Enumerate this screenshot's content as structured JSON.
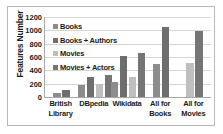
{
  "chart_data": {
    "type": "bar",
    "title": "",
    "xlabel": "",
    "ylabel": "Features Number",
    "ylim": [
      0,
      1200
    ],
    "yticks": [
      1200,
      1000,
      800,
      600,
      400,
      200,
      0
    ],
    "grid": true,
    "legend_position": "upper-left",
    "categories": [
      "British Library",
      "DBpedia",
      "Wikidata",
      "All for Books",
      "All for Movies"
    ],
    "category_lines": [
      [
        "British",
        "Library"
      ],
      [
        "DBpedia",
        ""
      ],
      [
        "Wikidata",
        ""
      ],
      [
        "All for",
        "Books"
      ],
      [
        "All for",
        "Movies"
      ]
    ],
    "series": [
      {
        "name": "Books",
        "color": "#8c8c8c",
        "values": [
          55,
          175,
          230,
          490,
          null
        ]
      },
      {
        "name": "Books + Authors",
        "color": "#6e6e6e",
        "values": [
          100,
          300,
          615,
          1050,
          null
        ]
      },
      {
        "name": "Movies",
        "color": "#bfbfbf",
        "values": [
          null,
          200,
          300,
          null,
          515
        ]
      },
      {
        "name": "Movies + Actors",
        "color": "#757575",
        "values": [
          null,
          325,
          655,
          null,
          995
        ]
      }
    ]
  },
  "legend": {
    "items": [
      {
        "label": "Books"
      },
      {
        "label": "Books + Authors"
      },
      {
        "label": "Movies"
      },
      {
        "label": "Movies + Actors"
      }
    ]
  }
}
